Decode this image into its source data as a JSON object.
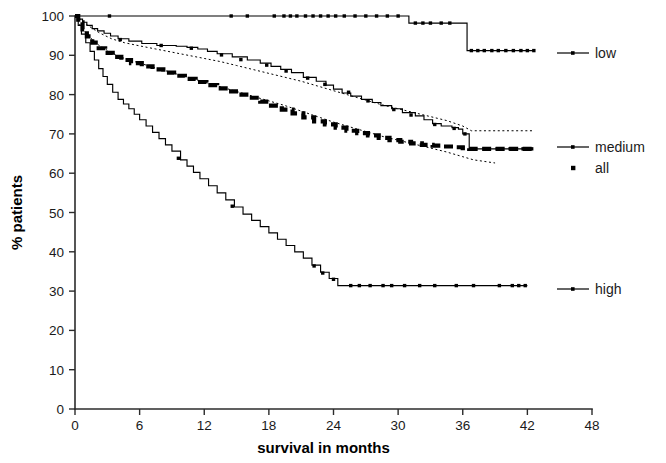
{
  "chart_data": {
    "type": "line",
    "title": "",
    "subtitle": "",
    "xlabel": "survival in months",
    "ylabel": "% patients",
    "xlim": [
      0,
      48
    ],
    "ylim": [
      0,
      100
    ],
    "xticks": [
      0,
      6,
      12,
      18,
      24,
      30,
      36,
      42,
      48
    ],
    "yticks": [
      0,
      10,
      20,
      30,
      40,
      50,
      60,
      70,
      80,
      90,
      100
    ],
    "xtick_labels": [
      "0",
      "6",
      "12",
      "18",
      "24",
      "30",
      "36",
      "42",
      "48"
    ],
    "ytick_labels": [
      "0",
      "10",
      "20",
      "30",
      "40",
      "50",
      "60",
      "70",
      "80",
      "90",
      "100"
    ],
    "grid": false,
    "legend_position": "right",
    "plot_kind": "kaplan-meier-step",
    "legend": [
      {
        "label": "low",
        "style": "solid-line-with-censor-marks"
      },
      {
        "label": "medium",
        "style": "solid-line-with-censor-marks"
      },
      {
        "label": "all",
        "style": "thick-dashed-line"
      },
      {
        "label": "high",
        "style": "solid-line-with-censor-marks"
      }
    ],
    "series": [
      {
        "name": "low",
        "style": "step",
        "x": [
          0,
          0.4,
          2.0,
          30.5,
          31.0,
          34.6,
          35.0,
          36.0,
          36.4,
          42.6
        ],
        "values": [
          100,
          100,
          100,
          100,
          98.2,
          98.2,
          98.2,
          98.2,
          91.2,
          91.2
        ],
        "censor_x": [
          3.2,
          14.5,
          16.0,
          18.5,
          19.4,
          20.0,
          20.6,
          21.4,
          22.1,
          22.8,
          23.5,
          24.2,
          25.0,
          26.0,
          27.0,
          28.0,
          29.0,
          30.0,
          31.6,
          32.3,
          33.0,
          34.0,
          34.8,
          36.8,
          37.4,
          38.0,
          38.7,
          39.3,
          40.0,
          40.7,
          41.4,
          42.0,
          42.6
        ],
        "censor_y": [
          100,
          100,
          100,
          100,
          100,
          100,
          100,
          100,
          100,
          100,
          100,
          100,
          100,
          100,
          100,
          100,
          100,
          100,
          98.2,
          98.2,
          98.2,
          98.2,
          98.2,
          91.2,
          91.2,
          91.2,
          91.2,
          91.2,
          91.2,
          91.2,
          91.2,
          91.2,
          91.2
        ]
      },
      {
        "name": "medium",
        "style": "step",
        "x": [
          0,
          0.3,
          0.7,
          1.1,
          1.6,
          2.1,
          2.7,
          3.3,
          4.0,
          5.0,
          6.2,
          7.6,
          9.4,
          10.4,
          11.4,
          12.3,
          13.2,
          14.6,
          16.0,
          17.2,
          18.2,
          19.1,
          20.1,
          21.2,
          22.4,
          23.3,
          24.0,
          24.8,
          25.6,
          26.6,
          27.6,
          28.4,
          29.4,
          30.4,
          31.6,
          32.4,
          33.2,
          34.0,
          35.0,
          35.6,
          36.0,
          36.6,
          42.4
        ],
        "values": [
          100,
          99.2,
          98.4,
          97.6,
          96.8,
          96.2,
          95.6,
          94.9,
          94.2,
          93.6,
          93.0,
          92.5,
          92.3,
          92.0,
          91.6,
          91.0,
          90.4,
          89.6,
          88.8,
          88.0,
          87.2,
          86.4,
          85.6,
          84.4,
          83.4,
          82.4,
          81.4,
          80.4,
          79.6,
          78.8,
          78.0,
          77.2,
          76.4,
          75.4,
          74.6,
          73.6,
          72.6,
          72.0,
          71.6,
          71.2,
          70.0,
          66.2,
          66.2
        ],
        "censor_x": [
          4.2,
          8.0,
          10.8,
          13.6,
          15.4,
          17.8,
          19.6,
          21.6,
          23.2,
          25.4,
          27.2,
          29.6,
          31.2,
          33.4,
          35.2,
          36.2,
          37.0,
          38.0,
          39.2,
          40.4,
          41.6,
          42.4
        ],
        "censor_y": [
          94.0,
          92.5,
          91.8,
          90.1,
          88.9,
          87.5,
          86.0,
          84.2,
          82.6,
          80.6,
          78.4,
          76.2,
          74.8,
          72.4,
          71.4,
          70.0,
          66.2,
          66.2,
          66.2,
          66.2,
          66.2,
          66.2
        ]
      },
      {
        "name": "all",
        "style": "step-thick-dashed",
        "x": [
          0,
          0.3,
          0.7,
          1.1,
          1.6,
          2.2,
          2.8,
          3.5,
          4.3,
          5.2,
          6.2,
          7.2,
          8.2,
          9.2,
          10.2,
          11.2,
          12.2,
          13.2,
          14.2,
          15.2,
          16.2,
          17.2,
          18.2,
          19.2,
          20.2,
          21.2,
          22.2,
          23.2,
          24.2,
          25.2,
          26.2,
          27.2,
          28.2,
          29.2,
          30.2,
          31.2,
          32.2,
          33.2,
          34.2,
          35.2,
          36.0,
          36.6,
          42.6
        ],
        "values": [
          100,
          98.4,
          96.6,
          94.8,
          93.2,
          91.8,
          90.6,
          89.6,
          88.8,
          88.0,
          87.2,
          86.4,
          85.6,
          84.8,
          84.0,
          83.2,
          82.4,
          81.6,
          80.8,
          80.0,
          79.2,
          78.2,
          77.2,
          76.2,
          75.2,
          74.2,
          73.2,
          72.4,
          71.6,
          70.8,
          70.2,
          69.6,
          69.0,
          68.4,
          68.0,
          67.6,
          67.2,
          67.0,
          66.8,
          66.6,
          66.4,
          66.2,
          66.2
        ]
      },
      {
        "name": "all_ci_upper",
        "style": "dotted",
        "x": [
          0,
          0.5,
          1.2,
          2.2,
          3.4,
          4.6,
          6.0,
          7.5,
          9.0,
          10.5,
          12.0,
          13.5,
          15.0,
          16.5,
          18.0,
          19.5,
          21.0,
          22.5,
          24.0,
          25.5,
          27.0,
          28.5,
          30.0,
          31.5,
          33.0,
          34.5,
          36.0,
          36.8,
          42.6
        ],
        "values": [
          100,
          99.2,
          97.6,
          95.8,
          94.2,
          93.2,
          92.4,
          91.6,
          90.8,
          90.0,
          89.2,
          88.4,
          87.4,
          86.4,
          85.4,
          84.4,
          83.4,
          82.2,
          81.0,
          79.8,
          78.6,
          77.4,
          76.4,
          75.4,
          74.4,
          73.4,
          72.0,
          70.8,
          70.8
        ]
      },
      {
        "name": "all_ci_lower",
        "style": "dotted",
        "x": [
          0,
          0.5,
          1.2,
          2.2,
          3.4,
          4.6,
          6.0,
          7.5,
          9.0,
          10.5,
          12.0,
          13.5,
          15.0,
          16.5,
          18.0,
          19.5,
          21.0,
          22.5,
          24.0,
          25.5,
          27.0,
          28.5,
          30.0,
          31.5,
          33.0,
          34.5,
          36.0,
          37.0,
          39.0
        ],
        "values": [
          100,
          97.6,
          95.0,
          92.6,
          90.6,
          89.2,
          88.0,
          86.8,
          85.6,
          84.4,
          83.2,
          82.0,
          80.8,
          79.6,
          78.4,
          77.2,
          75.8,
          74.4,
          73.0,
          71.8,
          70.6,
          69.4,
          68.4,
          67.4,
          66.4,
          65.4,
          64.2,
          63.4,
          62.6
        ]
      },
      {
        "name": "high",
        "style": "step",
        "x": [
          0,
          0.3,
          0.6,
          1.0,
          1.4,
          1.8,
          2.2,
          2.6,
          3.0,
          3.5,
          4.0,
          4.5,
          5.0,
          5.5,
          6.0,
          6.6,
          7.2,
          7.8,
          8.4,
          9.0,
          9.8,
          10.4,
          11.0,
          11.6,
          12.4,
          13.2,
          14.0,
          14.8,
          15.6,
          16.4,
          17.2,
          18.0,
          18.8,
          19.6,
          20.4,
          21.2,
          22.0,
          22.8,
          23.6,
          24.4,
          25.2,
          42.0
        ],
        "values": [
          100,
          97.6,
          95.4,
          93.2,
          91.0,
          88.8,
          86.6,
          84.6,
          82.6,
          80.6,
          78.8,
          77.6,
          76.4,
          75.0,
          73.6,
          72.0,
          70.4,
          68.8,
          67.2,
          65.6,
          63.4,
          61.8,
          60.2,
          58.6,
          56.8,
          55.0,
          53.2,
          51.4,
          49.6,
          48.0,
          46.4,
          44.8,
          43.2,
          41.6,
          40.0,
          38.4,
          36.6,
          34.8,
          33.2,
          31.4,
          31.4,
          31.4
        ],
        "censor_x": [
          9.6,
          14.6,
          22.2,
          23.0,
          24.0,
          25.6,
          26.4,
          27.4,
          28.6,
          29.4,
          30.6,
          32.0,
          33.4,
          35.4,
          37.0,
          39.4,
          40.6,
          41.2,
          41.8
        ],
        "censor_y": [
          63.8,
          51.6,
          36.4,
          34.6,
          33.0,
          31.4,
          31.4,
          31.4,
          31.4,
          31.4,
          31.4,
          31.4,
          31.4,
          31.4,
          31.4,
          31.4,
          31.4,
          31.4,
          31.4
        ]
      }
    ],
    "annotations": [],
    "colors": {
      "axis": "#2b2b2b",
      "curve": "#000000",
      "background": "#ffffff"
    }
  },
  "legend_items": {
    "low": "low",
    "medium": "medium",
    "all": "all",
    "high": "high"
  },
  "axis_titles": {
    "x": "survival in months",
    "y": "% patients"
  }
}
